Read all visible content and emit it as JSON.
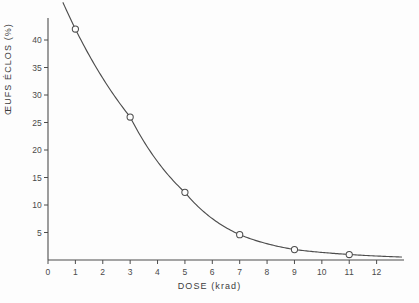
{
  "chart_data": {
    "type": "line",
    "title": "",
    "subtitle": "",
    "xlabel": "DOSE (krad)",
    "ylabel": "ŒUFS ÉCLOS (%)",
    "x": [
      1,
      3,
      5,
      7,
      9,
      11
    ],
    "values": [
      42.0,
      26.0,
      12.3,
      4.6,
      1.9,
      1.0
    ],
    "series": [
      {
        "name": "Œufs éclos",
        "x": [
          1,
          3,
          5,
          7,
          9,
          11
        ],
        "values": [
          42.0,
          26.0,
          12.3,
          4.6,
          1.9,
          1.0
        ]
      }
    ],
    "xlim": [
      0,
      13
    ],
    "ylim": [
      0,
      44
    ],
    "xticks": [
      0,
      1,
      2,
      3,
      4,
      5,
      6,
      7,
      8,
      9,
      10,
      11,
      12
    ],
    "yticks": [
      5,
      10,
      15,
      20,
      25,
      30,
      35,
      40
    ],
    "xtick_labels": [
      "0",
      "1",
      "2",
      "3",
      "4",
      "5",
      "6",
      "7",
      "8",
      "9",
      "10",
      "11",
      "12"
    ],
    "ytick_labels": [
      "5",
      "10",
      "15",
      "20",
      "25",
      "30",
      "35",
      "40"
    ],
    "grid": false,
    "legend": false,
    "legend_position": "none",
    "marker": "open-circle",
    "line_color": "#4d4d4d",
    "marker_color": "#4d4d4d",
    "axis_color": "#4d4d4d",
    "background_color": "#fdfdfd",
    "annotations": []
  }
}
